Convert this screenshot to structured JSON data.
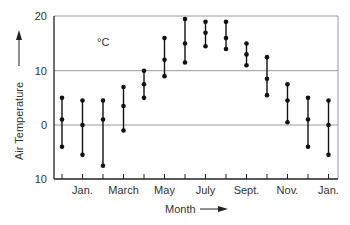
{
  "chart_data": {
    "type": "range",
    "title": "",
    "xlabel": "Month",
    "ylabel": "Air Temperature",
    "unit_label": "°C",
    "ylim": [
      -10,
      20
    ],
    "grid": {
      "y_lines_at": [
        10,
        0
      ],
      "x": false
    },
    "y_ticks": [
      {
        "value": 20,
        "label": "20"
      },
      {
        "value": 10,
        "label": "10"
      },
      {
        "value": 0,
        "label": "0"
      },
      {
        "value": -10,
        "label": "10"
      }
    ],
    "x_tick_labels": [
      {
        "index": 1,
        "label": "Jan."
      },
      {
        "index": 3,
        "label": "March"
      },
      {
        "index": 5,
        "label": "May"
      },
      {
        "index": 7,
        "label": "July"
      },
      {
        "index": 9,
        "label": "Sept."
      },
      {
        "index": 11,
        "label": "Nov."
      },
      {
        "index": 13,
        "label": "Jan."
      }
    ],
    "categories": [
      "Dec.",
      "Jan.",
      "Feb.",
      "March",
      "April",
      "May",
      "June",
      "July",
      "Aug.",
      "Sept.",
      "Oct.",
      "Nov.",
      "Dec.",
      "Jan."
    ],
    "series": [
      {
        "name": "Maximum",
        "values": [
          5,
          4.5,
          4.5,
          7,
          10,
          16,
          19.5,
          19,
          19,
          15,
          12.5,
          7.5,
          5,
          4.5
        ]
      },
      {
        "name": "Mean",
        "values": [
          1,
          0,
          1,
          3.5,
          7.5,
          12,
          15,
          17,
          16,
          13,
          8.5,
          4.5,
          1,
          0
        ]
      },
      {
        "name": "Minimum",
        "values": [
          -4,
          -5.5,
          -7.5,
          -1,
          5,
          9,
          11.5,
          14.5,
          14,
          11,
          5.5,
          0.5,
          -4,
          -5.5
        ]
      }
    ],
    "colors": {
      "data": "#111111",
      "grid": "#9a9a9a",
      "axis": "#222222",
      "text": "#333333"
    }
  }
}
